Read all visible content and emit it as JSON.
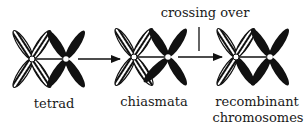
{
  "diagram": {
    "labels": {
      "tetrad": "tetrad",
      "chiasmata": "chiasmata",
      "recombinant_line1": "recombinant",
      "recombinant_line2": "chromosomes",
      "crossing_over": "crossing over"
    },
    "stages": [
      {
        "name": "tetrad"
      },
      {
        "name": "chiasmata"
      },
      {
        "name": "recombinant chromosomes"
      }
    ],
    "colors": {
      "black_chromosome": "#111111",
      "hatched_chromosome": "#111111",
      "background": "#ffffff"
    }
  }
}
